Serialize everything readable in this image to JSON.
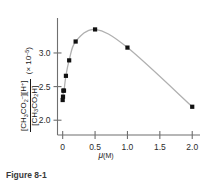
{
  "chart_data": {
    "type": "line",
    "title": "",
    "subtitle": "",
    "xlabel": "μ(M)",
    "ylabel_numerator": "[CH3CO2-][H+]",
    "ylabel_denominator": "[CH3CO2H]",
    "ylabel_multiplier": "(× 10-5)",
    "x": [
      0.0,
      0.005,
      0.01,
      0.02,
      0.05,
      0.1,
      0.2,
      0.5,
      1.0,
      2.0
    ],
    "y": [
      2.3,
      2.35,
      2.44,
      2.44,
      2.66,
      2.89,
      3.17,
      3.35,
      3.08,
      2.2
    ],
    "xlim": [
      -0.08,
      2.12
    ],
    "ylim": [
      1.78,
      3.52
    ],
    "xticks": [
      0,
      0.5,
      1.0,
      1.5,
      2.0
    ],
    "xticklabels": [
      "0",
      "0.5",
      "1.0",
      "1.5",
      "2.0"
    ],
    "yticks": [
      2.0,
      2.5,
      3.0
    ],
    "yticklabels": [
      "2.0",
      "2.5",
      "3.0"
    ],
    "grid": false,
    "legend": null,
    "marker": "square",
    "marker_color": "#111111",
    "line_color": "#b0b0b0",
    "axis_color": "#6f6f6f"
  },
  "figure": {
    "caption": "Figure 8-1",
    "xaxis_label_symbol": "μ",
    "xaxis_label_unit": "(M)",
    "yaxis_multiplier_prefix": "(× 10",
    "yaxis_multiplier_exp": "–5",
    "yaxis_multiplier_suffix": ")",
    "num_part1": "[CH",
    "num_sub1": "3",
    "num_part2": "CO",
    "num_sub2": "2",
    "num_sup1": "–",
    "num_part3": "][H",
    "num_sup2": "+",
    "num_part4": "]",
    "den_part1": "[CH",
    "den_sub1": "3",
    "den_part2": "CO",
    "den_sub2": "2",
    "den_part3": "H]"
  }
}
